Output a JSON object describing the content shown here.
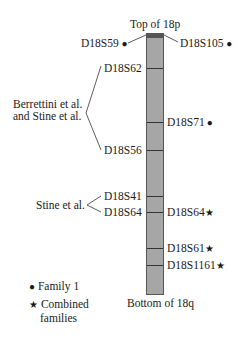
{
  "chromosome": {
    "top_label": "Top of 18p",
    "bottom_label": "Bottom of 18q",
    "bar_color": "#a6a6a6",
    "cap_color": "#555555"
  },
  "markers_left": [
    {
      "name": "D18S59",
      "symbol": "●"
    },
    {
      "name": "D18S62"
    },
    {
      "name": "D18S56"
    },
    {
      "name": "D18S41"
    },
    {
      "name": "D18S64"
    }
  ],
  "markers_right": [
    {
      "name": "D18S105",
      "symbol": "●"
    },
    {
      "name": "D18S71",
      "symbol": "●"
    },
    {
      "name": "D18S64",
      "symbol": "★"
    },
    {
      "name": "D18S61",
      "symbol": "★"
    },
    {
      "name": "D18S1161",
      "symbol": "★"
    }
  ],
  "studies": [
    {
      "label_line1": "Berrettini et al.",
      "label_line2": "and Stine et al.",
      "markers": [
        "D18S62",
        "D18S56"
      ]
    },
    {
      "label": "Stine et al.",
      "markers": [
        "D18S41",
        "D18S64"
      ]
    }
  ],
  "legend": [
    {
      "symbol": "●",
      "line1": "Family 1"
    },
    {
      "symbol": "★",
      "line1": "Combined",
      "line2": "families"
    }
  ]
}
